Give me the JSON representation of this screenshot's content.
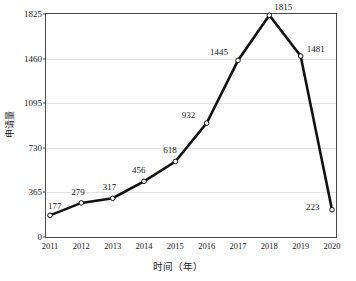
{
  "chart_data": {
    "type": "line",
    "title": "",
    "xlabel": "时间（年）",
    "ylabel": "申请量",
    "categories": [
      "2011",
      "2012",
      "2013",
      "2014",
      "2015",
      "2016",
      "2017",
      "2018",
      "2019",
      "2020"
    ],
    "values": [
      177,
      279,
      317,
      456,
      618,
      932,
      1445,
      1815,
      1481,
      223
    ],
    "series": [
      {
        "name": "申请量",
        "values": [
          177,
          279,
          317,
          456,
          618,
          932,
          1445,
          1815,
          1481,
          223
        ]
      }
    ],
    "data_labels": [
      "177",
      "279",
      "317",
      "456",
      "618",
      "932",
      "1445",
      "1815",
      "1481",
      "223"
    ],
    "ylim": [
      0,
      1825
    ],
    "yticks": [
      0,
      365,
      730,
      1095,
      1460,
      1825
    ],
    "ytick_labels": [
      "0",
      "365",
      "730",
      "1095",
      "1460",
      "1825"
    ],
    "xtick_labels": [
      "2011",
      "2012",
      "2013",
      "2014",
      "2015",
      "2016",
      "2017",
      "2018",
      "2019",
      "2020"
    ],
    "grid": true,
    "grid_axis": "y",
    "legend": false,
    "legend_position": "none",
    "line_color": "#111111",
    "marker": "open-circle",
    "marker_face_color": "#ffffff",
    "marker_edge_color": "#111111",
    "grid_color": "#e3e3e3",
    "axis_color": "#4a4a4a",
    "background_color": "#ffffff",
    "label_offsets": [
      {
        "value": "177",
        "dx": -2,
        "dy": -13,
        "align": "left"
      },
      {
        "value": "279",
        "dx": -10,
        "dy": -15,
        "align": "center"
      },
      {
        "value": "317",
        "dx": -10,
        "dy": -15,
        "align": "center"
      },
      {
        "value": "456",
        "dx": -12,
        "dy": -15,
        "align": "center"
      },
      {
        "value": "618",
        "dx": -12,
        "dy": -15,
        "align": "center"
      },
      {
        "value": "932",
        "dx": -25,
        "dy": -12,
        "align": "right"
      },
      {
        "value": "1445",
        "dx": -28,
        "dy": -12,
        "align": "right"
      },
      {
        "value": "1815",
        "dx": 5,
        "dy": -12,
        "align": "left"
      },
      {
        "value": "1481",
        "dx": 6,
        "dy": -11,
        "align": "left"
      },
      {
        "value": "223",
        "dx": -26,
        "dy": -7,
        "align": "right"
      }
    ]
  }
}
